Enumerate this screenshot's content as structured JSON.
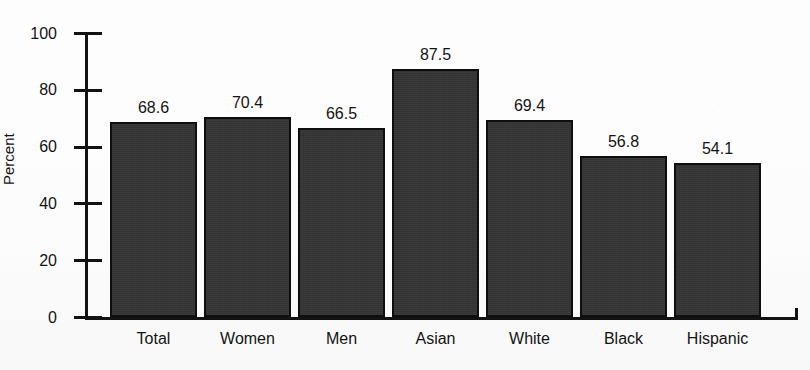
{
  "chart_data": {
    "type": "bar",
    "title": "",
    "xlabel": "",
    "ylabel": "Percent",
    "categories": [
      "Total",
      "Women",
      "Men",
      "Asian",
      "White",
      "Black",
      "Hispanic"
    ],
    "values": [
      68.6,
      70.4,
      66.5,
      87.5,
      69.4,
      56.8,
      54.1
    ],
    "value_labels": [
      "68.6",
      "70.4",
      "66.5",
      "87.5",
      "69.4",
      "56.8",
      "54.1"
    ],
    "ylim": [
      0,
      100
    ],
    "ytick_values": [
      0,
      20,
      40,
      60,
      80,
      100
    ],
    "ytick_labels": [
      "0",
      "20",
      "40",
      "60",
      "80",
      "100"
    ],
    "grid": false,
    "legend": false,
    "legend_position": "none",
    "bar_color": "#343434",
    "bar_edge_color": "#0e0e0e",
    "axis_color": "#121212",
    "background_color": "#fcfcfc",
    "text_color": "#141414"
  }
}
